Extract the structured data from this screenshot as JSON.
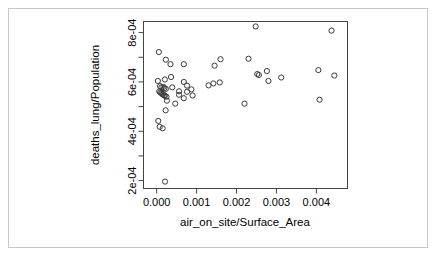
{
  "figure": {
    "background_color": "#ffffff",
    "frame_color": "#c9c9c9",
    "point_color": "#3a3a3a",
    "axis_color": "#444444"
  },
  "chart_data": {
    "type": "scatter",
    "title": "",
    "xlabel": "air_on_site/Surface_Area",
    "ylabel": "deaths_lung/Population",
    "xlim": [
      -0.00033,
      0.00478
    ],
    "ylim": [
      0.000168,
      0.000845
    ],
    "xticks": [
      0.0,
      0.001,
      0.002,
      0.003,
      0.004
    ],
    "xtick_labels": [
      "0.000",
      "0.001",
      "0.002",
      "0.003",
      "0.004"
    ],
    "yticks": [
      0.0002,
      0.0004,
      0.0006,
      0.0008
    ],
    "ytick_labels": [
      "2e-04",
      "4e-04",
      "6e-04",
      "8e-04"
    ],
    "yticks_minor": [
      0.0003,
      0.0005,
      0.0007
    ],
    "grid": false,
    "legend": false,
    "marker": "open-circle",
    "n_points": 53,
    "x": [
      5.5e-05,
      0.00023,
      0.000345,
      0.00036,
      0.00068,
      0.000205,
      3e-05,
      8.5e-05,
      0.00012,
      0.00017,
      0.000195,
      0.00023,
      0.00039,
      0.00068,
      0.00076,
      0.00087,
      6.5e-05,
      9e-05,
      0.000115,
      0.000135,
      0.000155,
      0.000185,
      0.000205,
      0.000245,
      0.00056,
      0.000255,
      0.000465,
      4e-05,
      7.5e-05,
      0.00015,
      0.000225,
      0.0013,
      0.00145,
      0.00158,
      0.00142,
      0.0016,
      0.0022,
      0.0023,
      0.00248,
      0.00252,
      0.00256,
      0.00276,
      0.0028,
      0.00312,
      0.00405,
      0.00408,
      0.00438,
      0.00445,
      0.00076,
      0.0009,
      0.00056,
      0.00068,
      0.00021
    ],
    "y": [
      0.000721,
      0.00069,
      0.000672,
      0.00062,
      0.000672,
      0.00061,
      0.000604,
      0.000583,
      0.000578,
      0.00058,
      0.000575,
      0.000572,
      0.000578,
      0.0006,
      0.000585,
      0.00057,
      0.000562,
      0.000558,
      0.000555,
      0.000552,
      0.000549,
      0.000546,
      0.000544,
      0.00054,
      0.000548,
      0.000524,
      0.000512,
      0.000442,
      0.000418,
      0.000412,
      0.000485,
      0.000586,
      0.000666,
      0.000598,
      0.000594,
      0.000692,
      0.000512,
      0.000694,
      0.000825,
      0.000632,
      0.000628,
      0.000644,
      0.000604,
      0.000618,
      0.000648,
      0.000528,
      0.000808,
      0.000626,
      0.00056,
      0.000545,
      0.000562,
      0.000534,
      0.000196
    ]
  }
}
